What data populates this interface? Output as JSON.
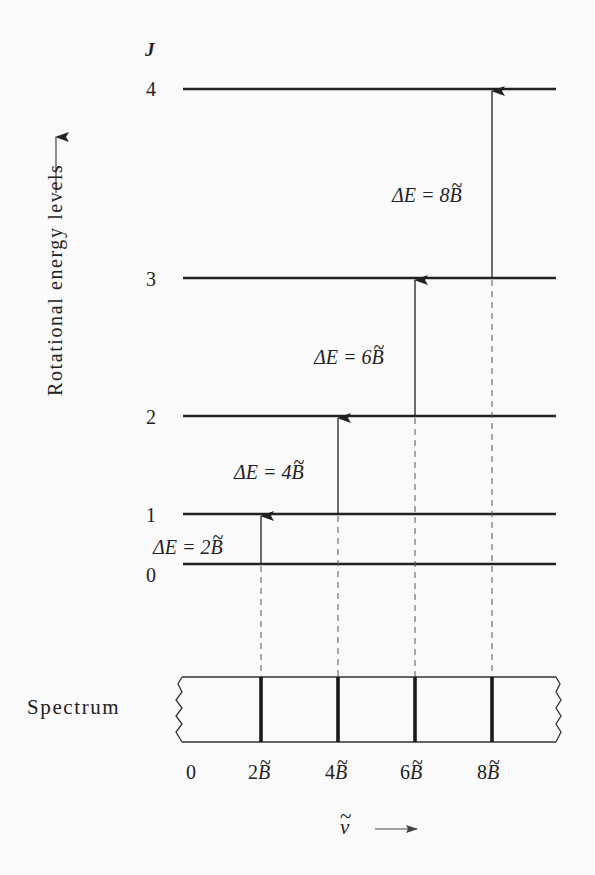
{
  "diagram": {
    "y_axis_label": "Rotational energy levels",
    "level_axis_symbol": "J",
    "levels": [
      {
        "J": "0",
        "y": 564
      },
      {
        "J": "1",
        "y": 514
      },
      {
        "J": "2",
        "y": 416
      },
      {
        "J": "3",
        "y": 278
      },
      {
        "J": "4",
        "y": 89
      }
    ],
    "transitions": [
      {
        "from": "0",
        "to": "1",
        "label_prefix": "ΔE = 2",
        "symbol": "B",
        "x": 261
      },
      {
        "from": "1",
        "to": "2",
        "label_prefix": "ΔE = 4",
        "symbol": "B",
        "x": 338
      },
      {
        "from": "2",
        "to": "3",
        "label_prefix": "ΔE = 6",
        "symbol": "B",
        "x": 415
      },
      {
        "from": "3",
        "to": "4",
        "label_prefix": "ΔE = 8",
        "symbol": "B",
        "x": 492
      }
    ],
    "spectrum_label": "Spectrum",
    "spectrum_ticks": [
      {
        "coef": "0",
        "symbol": ""
      },
      {
        "coef": "2",
        "symbol": "B"
      },
      {
        "coef": "4",
        "symbol": "B"
      },
      {
        "coef": "6",
        "symbol": "B"
      },
      {
        "coef": "8",
        "symbol": "B"
      }
    ],
    "x_axis_symbol": "ν",
    "colors": {
      "background": "#fafafa",
      "ink": "#222222",
      "dashed": "#555555"
    }
  }
}
